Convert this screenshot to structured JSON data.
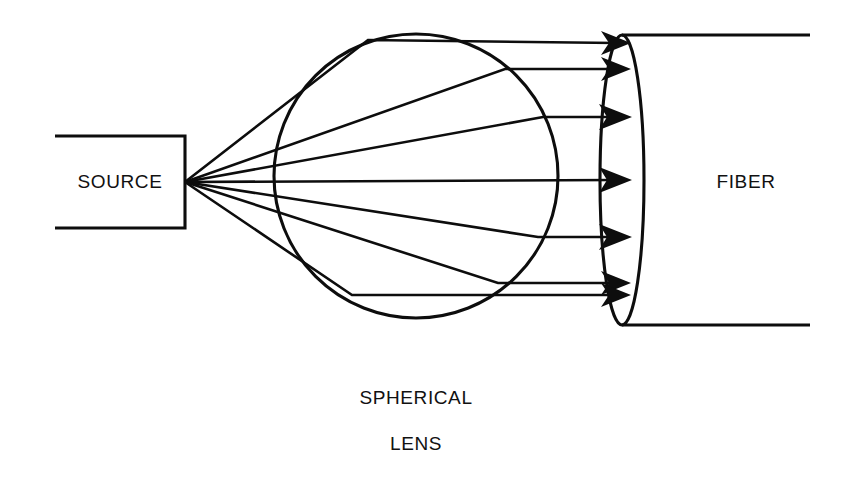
{
  "diagram": {
    "background_color": "#ffffff",
    "stroke_color": "#0d0d0d",
    "labels": {
      "source": "SOURCE",
      "fiber": "FIBER",
      "lens_line_1": "SPHERICAL",
      "lens_line_2": "LENS"
    },
    "components": [
      {
        "name": "source-box",
        "label": "SOURCE",
        "shape": "rectangle-open-left",
        "x": 55,
        "y": 136,
        "width": 130,
        "height": 92
      },
      {
        "name": "spherical-lens",
        "label": "SPHERICAL LENS",
        "shape": "circle",
        "cx": 416,
        "cy": 176,
        "r": 142
      },
      {
        "name": "fiber",
        "label": "FIBER",
        "shape": "cylinder",
        "face_cx": 622,
        "face_cy": 180,
        "face_rx": 22,
        "face_ry": 145,
        "body_right_x": 810
      }
    ],
    "source_point": {
      "x": 185,
      "y": 182
    },
    "ray_count": 6,
    "rays": [
      {
        "id": "ray-1",
        "bend_x": 368,
        "bend_y": 40,
        "arrow_y": 43,
        "note": "outermost upper ray"
      },
      {
        "id": "ray-2",
        "bend_x": 505,
        "bend_y": 69,
        "arrow_y": 69,
        "note": "upper ray"
      },
      {
        "id": "ray-3",
        "bend_x": 543,
        "bend_y": 117,
        "arrow_y": 117,
        "note": "inner upper ray"
      },
      {
        "id": "ray-4",
        "bend_x": 185,
        "bend_y": 180,
        "arrow_y": 180,
        "note": "axial ray"
      },
      {
        "id": "ray-5",
        "bend_x": 538,
        "bend_y": 237,
        "arrow_y": 237,
        "note": "inner lower ray"
      },
      {
        "id": "ray-6",
        "bend_x": 498,
        "bend_y": 283,
        "arrow_y": 283,
        "note": "lower ray"
      },
      {
        "id": "ray-7",
        "bend_x": 352,
        "bend_y": 295,
        "arrow_y": 295,
        "note": "outermost lower ray"
      }
    ]
  }
}
